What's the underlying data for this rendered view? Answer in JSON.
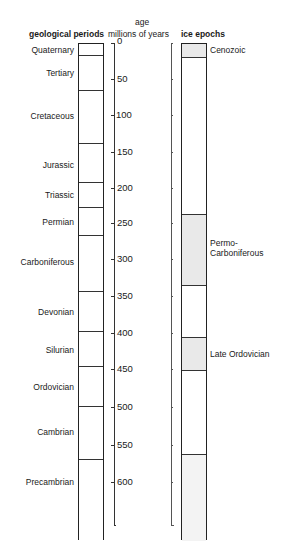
{
  "header": {
    "age_line1": "age",
    "left_title": "geological periods",
    "middle_title": "millions of years",
    "right_title": "ice epochs"
  },
  "periods": [
    {
      "name": "Quaternary",
      "top": 43,
      "bottom": 55,
      "label_y": 50
    },
    {
      "name": "Tertiary",
      "top": 55,
      "bottom": 90,
      "label_y": 73
    },
    {
      "name": "Cretaceous",
      "top": 90,
      "bottom": 143,
      "label_y": 116
    },
    {
      "name": "Jurassic",
      "top": 143,
      "bottom": 182,
      "label_y": 165
    },
    {
      "name": "Triassic",
      "top": 182,
      "bottom": 207,
      "label_y": 195
    },
    {
      "name": "Permian",
      "top": 207,
      "bottom": 235,
      "label_y": 222
    },
    {
      "name": "Carboniferous",
      "top": 235,
      "bottom": 291,
      "label_y": 262
    },
    {
      "name": "Devonian",
      "top": 291,
      "bottom": 331,
      "label_y": 312
    },
    {
      "name": "Silurian",
      "top": 331,
      "bottom": 366,
      "label_y": 350
    },
    {
      "name": "Ordovician",
      "top": 366,
      "bottom": 406,
      "label_y": 387
    },
    {
      "name": "Cambrian",
      "top": 406,
      "bottom": 459,
      "label_y": 432
    },
    {
      "name": "Precambrian",
      "top": 459,
      "bottom": 540,
      "label_y": 482
    }
  ],
  "axis": {
    "ticks": [
      {
        "value": "0",
        "y": 43
      },
      {
        "value": "50",
        "y": 79
      },
      {
        "value": "100",
        "y": 115
      },
      {
        "value": "150",
        "y": 152
      },
      {
        "value": "200",
        "y": 188
      },
      {
        "value": "250",
        "y": 223
      },
      {
        "value": "300",
        "y": 259
      },
      {
        "value": "350",
        "y": 296
      },
      {
        "value": "400",
        "y": 333
      },
      {
        "value": "450",
        "y": 369
      },
      {
        "value": "500",
        "y": 407
      },
      {
        "value": "550",
        "y": 445
      },
      {
        "value": "600",
        "y": 482
      }
    ],
    "unit": "millions of years"
  },
  "ice_epochs": [
    {
      "name": "Cenozoic",
      "top": 43,
      "bottom": 57,
      "label_y": 50,
      "shade": "#e9e9e9"
    },
    {
      "name": "Permo-\nCarboniferous",
      "line1": "Permo-",
      "line2": "Carboniferous",
      "top": 213,
      "bottom": 285,
      "label_y": 243,
      "shade": "#e9e9e9"
    },
    {
      "name": "Late Ordovician",
      "top": 336,
      "bottom": 370,
      "label_y": 354,
      "shade": "#e9e9e9"
    },
    {
      "name": "",
      "top": 453,
      "bottom": 540,
      "shade": "#f3f3f3"
    }
  ],
  "colors": {
    "line": "#222222",
    "shade": "#e9e9e9",
    "shade_light": "#f3f3f3"
  }
}
